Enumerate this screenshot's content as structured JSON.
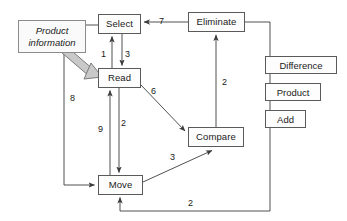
{
  "diagram": {
    "nodes": [
      {
        "id": "select",
        "label": "Select",
        "x": 98,
        "y": 14,
        "w": 43,
        "h": 20
      },
      {
        "id": "read",
        "label": "Read",
        "x": 98,
        "y": 68,
        "w": 43,
        "h": 20
      },
      {
        "id": "eliminate",
        "label": "Eliminate",
        "x": 188,
        "y": 12,
        "w": 57,
        "h": 20
      },
      {
        "id": "compare",
        "label": "Compare",
        "x": 188,
        "y": 127,
        "w": 56,
        "h": 20
      },
      {
        "id": "move",
        "label": "Move",
        "x": 98,
        "y": 175,
        "w": 45,
        "h": 20
      }
    ],
    "note": {
      "id": "product-information",
      "label": "Product\ninformation",
      "line1": "Product",
      "line2": "information",
      "x": 18,
      "y": 20,
      "w": 68,
      "h": 33
    },
    "legend": {
      "items": [
        {
          "id": "difference",
          "label": "Difference",
          "x": 265,
          "y": 56,
          "w": 72,
          "h": 18
        },
        {
          "id": "product",
          "label": "Product",
          "x": 265,
          "y": 83,
          "w": 56,
          "h": 18
        },
        {
          "id": "add",
          "label": "Add",
          "x": 265,
          "y": 110,
          "w": 41,
          "h": 18
        }
      ]
    },
    "edges": [
      {
        "id": "read-to-select",
        "label": "1",
        "from": "read",
        "to": "select",
        "lx": 101,
        "ly": 50
      },
      {
        "id": "select-to-read",
        "label": "3",
        "from": "select",
        "to": "read",
        "lx": 125,
        "ly": 50
      },
      {
        "id": "eliminate-to-select",
        "label": "7",
        "from": "eliminate",
        "to": "select",
        "lx": 159,
        "ly": 17
      },
      {
        "id": "compare-to-eliminate",
        "label": "2",
        "from": "compare",
        "to": "eliminate",
        "lx": 222,
        "ly": 78
      },
      {
        "id": "read-to-compare",
        "label": "6",
        "from": "read",
        "to": "compare",
        "lx": 151,
        "ly": 87
      },
      {
        "id": "select-to-move",
        "label": "8",
        "from": "select",
        "to": "move",
        "lx": 70,
        "ly": 94
      },
      {
        "id": "move-to-read",
        "label": "9",
        "from": "move",
        "to": "read",
        "lx": 98,
        "ly": 125
      },
      {
        "id": "read-to-move",
        "label": "2",
        "from": "read",
        "to": "move",
        "lx": 121,
        "ly": 119
      },
      {
        "id": "move-to-compare",
        "label": "3",
        "from": "move",
        "to": "compare",
        "lx": 170,
        "ly": 153
      },
      {
        "id": "eliminate-to-move",
        "label": "2",
        "from": "eliminate",
        "to": "move",
        "lx": 188,
        "ly": 199
      }
    ],
    "colors": {
      "stroke": "#5a5a5a",
      "note_stroke": "#8c8c8c",
      "thick_arrow_fill": "#c9c9c9",
      "thick_arrow_stroke": "#6f6f6f",
      "text": "#1a1a1a",
      "background": "#ffffff"
    }
  }
}
